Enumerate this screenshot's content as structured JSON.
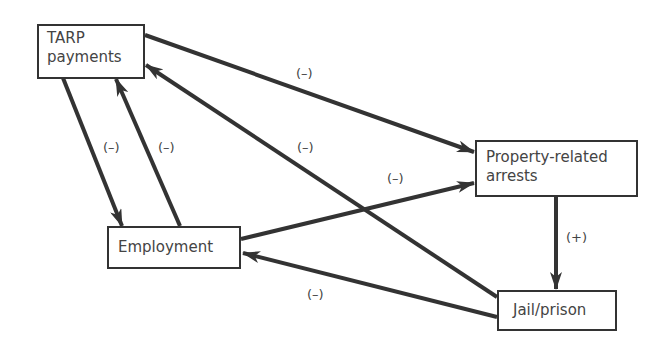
{
  "nodes": {
    "tarp": "TARP\npayments",
    "tarp_line1": "TARP",
    "tarp_line2": "payments",
    "arrests_line1": "Property-related",
    "arrests_line2": "arrests",
    "employment": "Employment",
    "jail": "Jail/prison"
  },
  "edges": [
    {
      "from": "TARP payments",
      "to": "Property-related arrests",
      "sign": "(–)"
    },
    {
      "from": "TARP payments",
      "to": "Employment",
      "sign": "(–)"
    },
    {
      "from": "Employment",
      "to": "TARP payments",
      "sign": "(–)"
    },
    {
      "from": "Jail/prison",
      "to": "TARP payments",
      "sign": "(–)"
    },
    {
      "from": "Employment",
      "to": "Property-related arrests",
      "sign": "(–)"
    },
    {
      "from": "Property-related arrests",
      "to": "Jail/prison",
      "sign": "(+)"
    },
    {
      "from": "Jail/prison",
      "to": "Employment",
      "sign": "(–)"
    }
  ],
  "colors": {
    "stroke": "#333333"
  }
}
